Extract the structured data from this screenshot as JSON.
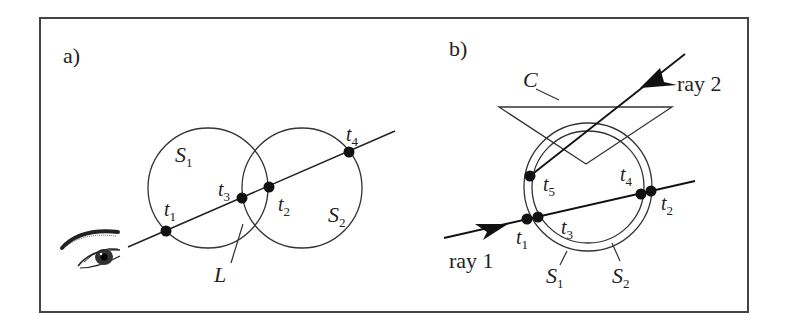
{
  "panel_a": {
    "tag": "a)",
    "sphere1": "S",
    "sphere1_sub": "1",
    "sphere2": "S",
    "sphere2_sub": "2",
    "line_label": "L",
    "points": [
      {
        "name": "t",
        "sub": "1"
      },
      {
        "name": "t",
        "sub": "3"
      },
      {
        "name": "t",
        "sub": "2"
      },
      {
        "name": "t",
        "sub": "4"
      }
    ],
    "eye_icon": "eye-icon"
  },
  "panel_b": {
    "tag": "b)",
    "cone_label": "C",
    "ray1": "ray 1",
    "ray2": "ray 2",
    "shell1": "S",
    "shell1_sub": "1",
    "shell2": "S",
    "shell2_sub": "2",
    "points": [
      {
        "name": "t",
        "sub": "1"
      },
      {
        "name": "t",
        "sub": "3"
      },
      {
        "name": "t",
        "sub": "4"
      },
      {
        "name": "t",
        "sub": "2"
      },
      {
        "name": "t",
        "sub": "5"
      }
    ]
  },
  "colors": {
    "stroke": "#333333",
    "frame": "#444444",
    "background": "#ffffff"
  }
}
